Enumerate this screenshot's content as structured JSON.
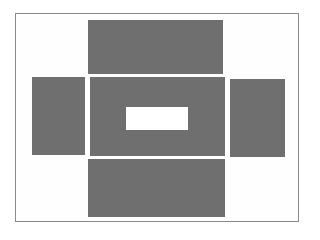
{
  "diagram": {
    "type": "box-net",
    "colors": {
      "panel": "#6f6f6f",
      "background": "#ffffff",
      "frame": "#8a8a8a"
    },
    "panels": [
      {
        "id": "top",
        "x": 88,
        "y": 20,
        "w": 135,
        "h": 54
      },
      {
        "id": "left",
        "x": 32,
        "y": 77,
        "w": 53,
        "h": 78
      },
      {
        "id": "center",
        "x": 90,
        "y": 77,
        "w": 135,
        "h": 79
      },
      {
        "id": "right",
        "x": 230,
        "y": 79,
        "w": 55,
        "h": 78
      },
      {
        "id": "bottom",
        "x": 88,
        "y": 159,
        "w": 137,
        "h": 58
      }
    ],
    "hole": {
      "x": 126,
      "y": 107,
      "w": 62,
      "h": 23
    }
  }
}
